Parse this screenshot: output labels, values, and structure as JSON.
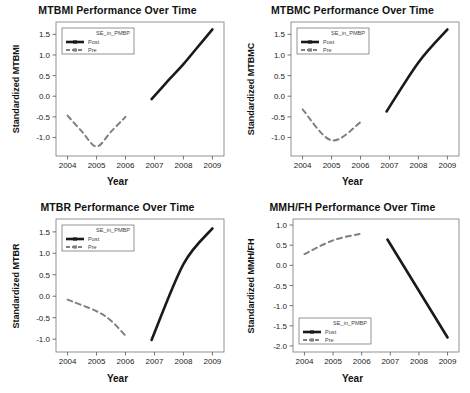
{
  "figure": {
    "xlabel": "Year",
    "background": "#ffffff",
    "line_color_post": "#1a1a1a",
    "line_color_pre": "#808080"
  },
  "chart_data": [
    {
      "type": "line",
      "title": "MTBMI Performance Over Time",
      "xlabel": "Year",
      "ylabel": "Standardized MTBMI",
      "xlim": [
        2003.6,
        2009.4
      ],
      "ylim": [
        -1.45,
        1.8
      ],
      "xticks": [
        2004,
        2005,
        2006,
        2007,
        2008,
        2009
      ],
      "xticklabels": [
        "2004",
        "2005",
        "2006",
        "2007",
        "2008",
        "2009"
      ],
      "yticks": [
        1.5,
        1.0,
        0.5,
        0.0,
        -0.5,
        -1.0
      ],
      "yticklabels": [
        "1.5",
        "1.0",
        "0.5",
        "0.0",
        "-0.5",
        "-1.0"
      ],
      "grid": false,
      "legend_title": "SE_in_PMBP",
      "legend_position": "upper left",
      "series": [
        {
          "name": "Post",
          "style": "solid",
          "x": [
            2006.9,
            2007.5,
            2008.0,
            2008.5,
            2009.0
          ],
          "values": [
            -0.07,
            0.4,
            0.78,
            1.2,
            1.62
          ]
        },
        {
          "name": "Pre",
          "style": "dashed",
          "x": [
            2004.0,
            2004.5,
            2005.0,
            2005.5,
            2006.0
          ],
          "values": [
            -0.47,
            -0.86,
            -1.22,
            -0.86,
            -0.5
          ]
        }
      ]
    },
    {
      "type": "line",
      "title": "MTBMC Performance Over Time",
      "xlabel": "Year",
      "ylabel": "Standardized MTBMC",
      "xlim": [
        2003.6,
        2009.4
      ],
      "ylim": [
        -1.45,
        1.8
      ],
      "xticks": [
        2004,
        2005,
        2006,
        2007,
        2008,
        2009
      ],
      "xticklabels": [
        "2004",
        "2005",
        "2006",
        "2007",
        "2008",
        "2009"
      ],
      "yticks": [
        1.5,
        1.0,
        0.5,
        0.0,
        -0.5,
        -1.0
      ],
      "yticklabels": [
        "1.5",
        "1.0",
        "0.5",
        "0.0",
        "-0.5",
        "-1.0"
      ],
      "grid": false,
      "legend_title": "SE_in_PMBP",
      "legend_position": "upper left",
      "series": [
        {
          "name": "Post",
          "style": "solid",
          "x": [
            2006.9,
            2008.0,
            2009.0
          ],
          "values": [
            -0.37,
            0.82,
            1.62
          ]
        },
        {
          "name": "Pre",
          "style": "dashed",
          "x": [
            2004.0,
            2005.0,
            2006.0
          ],
          "values": [
            -0.32,
            -1.07,
            -0.63
          ]
        }
      ]
    },
    {
      "type": "line",
      "title": "MTBR Performance Over Time",
      "xlabel": "Year",
      "ylabel": "Standardized MTBR",
      "xlim": [
        2003.6,
        2009.4
      ],
      "ylim": [
        -1.3,
        1.8
      ],
      "xticks": [
        2004,
        2005,
        2006,
        2007,
        2008,
        2009
      ],
      "xticklabels": [
        "2004",
        "2005",
        "2006",
        "2007",
        "2008",
        "2009"
      ],
      "yticks": [
        1.5,
        1.0,
        0.5,
        0.0,
        -0.5,
        -1.0
      ],
      "yticklabels": [
        "1.5",
        "1.0",
        "0.5",
        "0.0",
        "-0.5",
        "-1.0"
      ],
      "grid": false,
      "legend_title": "SE_in_PMBP",
      "legend_position": "upper left",
      "series": [
        {
          "name": "Post",
          "style": "solid",
          "x": [
            2006.9,
            2008.0,
            2009.0
          ],
          "values": [
            -1.02,
            0.75,
            1.58
          ]
        },
        {
          "name": "Pre",
          "style": "dashed",
          "x": [
            2004.0,
            2005.0,
            2005.5,
            2006.0
          ],
          "values": [
            -0.08,
            -0.35,
            -0.57,
            -0.92
          ]
        }
      ]
    },
    {
      "type": "line",
      "title": "MMH/FH Performance Over Time",
      "xlabel": "Year",
      "ylabel": "Standardized MMH/FH",
      "xlim": [
        2003.6,
        2009.4
      ],
      "ylim": [
        -2.15,
        1.15
      ],
      "xticks": [
        2004,
        2005,
        2006,
        2007,
        2008,
        2009
      ],
      "xticklabels": [
        "2004",
        "2005",
        "2006",
        "2007",
        "2008",
        "2009"
      ],
      "yticks": [
        1.0,
        0.5,
        0.0,
        -0.5,
        -1.0,
        -1.5,
        -2.0
      ],
      "yticklabels": [
        "1.0",
        "0.5",
        "0.0",
        "-0.5",
        "-1.0",
        "-1.5",
        "-2.0"
      ],
      "grid": false,
      "legend_title": "SE_in_PMBP",
      "legend_position": "lower left",
      "series": [
        {
          "name": "Post",
          "style": "solid",
          "x": [
            2006.9,
            2009.0
          ],
          "values": [
            0.64,
            -1.79
          ]
        },
        {
          "name": "Pre",
          "style": "dashed",
          "x": [
            2004.0,
            2005.0,
            2006.0
          ],
          "values": [
            0.28,
            0.62,
            0.79
          ]
        }
      ]
    }
  ]
}
